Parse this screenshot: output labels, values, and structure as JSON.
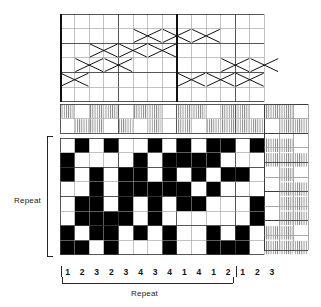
{
  "document": {
    "kind": "weaving-draft",
    "title": "Weaving draft: threading, tie-up, treadling and drawdown"
  },
  "colors": {
    "ink": "#111111",
    "grid_light": "#9a9a9a",
    "grid_dark": "#3a3a3a",
    "fill": "#000000",
    "background": "#ffffff"
  },
  "labels": {
    "repeat_horizontal": "Repeat",
    "repeat_vertical": "Repeat"
  },
  "geometry": {
    "cell": 14.6,
    "threading_cols": 14,
    "threading_rows": 6,
    "tieup_rows": 2,
    "drawdown_cols": 14,
    "drawdown_rows": 8,
    "treadling_cols": 3,
    "grid_left": 60,
    "grid_top": 14,
    "threading_bottom": 104,
    "tieup_bottom": 138,
    "drawdown_bottom": 261
  },
  "bottom_numbers": {
    "repeat_group": [
      "1",
      "2",
      "3",
      "2",
      "3",
      "4",
      "3",
      "4",
      "1",
      "4",
      "1",
      "2"
    ],
    "tail_group": [
      "1",
      "2",
      "3"
    ]
  },
  "chart_data": {
    "type": "heatmap",
    "xlabel": "Repeat",
    "ylabel": "Repeat",
    "threading": {
      "shafts": 6,
      "note": "X marks on a 14-column threading grid; row 0 = top shaft",
      "marks": [
        {
          "col": 0,
          "row": 4
        },
        {
          "col": 1,
          "row": 3
        },
        {
          "col": 2,
          "row": 2
        },
        {
          "col": 3,
          "row": 3
        },
        {
          "col": 4,
          "row": 2
        },
        {
          "col": 5,
          "row": 1
        },
        {
          "col": 6,
          "row": 2
        },
        {
          "col": 7,
          "row": 1
        },
        {
          "col": 8,
          "row": 4
        },
        {
          "col": 9,
          "row": 1
        },
        {
          "col": 10,
          "row": 4
        },
        {
          "col": 11,
          "row": 3
        },
        {
          "col": 12,
          "row": 4
        },
        {
          "col": 13,
          "row": 3
        }
      ]
    },
    "tieup": {
      "rows": 2,
      "cols": 14,
      "hatched": [
        [
          1,
          0,
          1,
          1,
          0,
          1,
          1,
          0,
          1,
          1,
          0,
          1,
          1,
          0
        ],
        [
          0,
          1,
          1,
          0,
          1,
          0,
          1,
          0,
          1,
          0,
          1,
          1,
          1,
          1
        ]
      ]
    },
    "drawdown": {
      "cols": 14,
      "rows": 8,
      "cells": [
        [
          0,
          1,
          0,
          1,
          0,
          0,
          1,
          0,
          1,
          0,
          1,
          1,
          0,
          1
        ],
        [
          1,
          0,
          0,
          0,
          0,
          1,
          0,
          1,
          1,
          1,
          1,
          0,
          0,
          0
        ],
        [
          1,
          0,
          1,
          0,
          1,
          1,
          0,
          1,
          0,
          1,
          0,
          1,
          1,
          0
        ],
        [
          0,
          0,
          1,
          0,
          1,
          1,
          1,
          1,
          1,
          0,
          1,
          0,
          0,
          0
        ],
        [
          0,
          1,
          1,
          0,
          1,
          0,
          1,
          0,
          1,
          1,
          0,
          0,
          0,
          1
        ],
        [
          0,
          1,
          1,
          1,
          1,
          0,
          1,
          0,
          0,
          0,
          0,
          0,
          0,
          1
        ],
        [
          1,
          0,
          1,
          1,
          0,
          1,
          0,
          1,
          0,
          0,
          1,
          0,
          1,
          0
        ],
        [
          1,
          1,
          0,
          1,
          0,
          0,
          0,
          1,
          0,
          0,
          1,
          1,
          1,
          0
        ]
      ]
    },
    "treadling": {
      "cols": 3,
      "rows": 8,
      "hatched": [
        [
          1,
          1,
          0
        ],
        [
          1,
          1,
          1
        ],
        [
          0,
          1,
          0
        ],
        [
          0,
          1,
          1
        ],
        [
          0,
          1,
          1
        ],
        [
          0,
          1,
          1
        ],
        [
          1,
          1,
          0
        ],
        [
          1,
          1,
          1
        ]
      ]
    }
  }
}
